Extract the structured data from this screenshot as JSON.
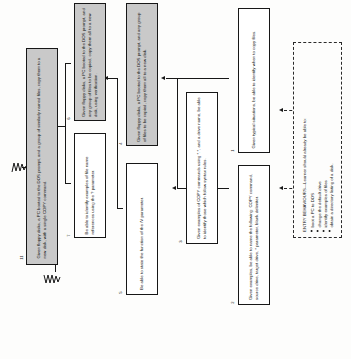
{
  "diagram": {
    "type": "instructional-goal-hierarchy",
    "title_visible": false,
    "colors": {
      "shaded_fill": "#c9c9c9",
      "line": "#171717",
      "paper": "#fdfdfc"
    },
    "orientation": "rotated-90-ccw"
  },
  "nodes": [
    {
      "id": "11",
      "tag": "11",
      "shaded": true,
      "text": "Given floppy disks, a PC booted to the DOS prompt, and a group of similarly named files, copy them to a new disk, with a single COPY command."
    },
    {
      "id": "6",
      "tag": "6",
      "shaded": true,
      "text": "Given floppy disks, a PC booted to the DOS prompt, and any group of files to be copied, copy them all to a new disk, using verification."
    },
    {
      "id": "7",
      "tag": "7",
      "shaded": false,
      "text": "Be able to identify examples of file name references using the ? parameter."
    },
    {
      "id": "4",
      "tag": "4",
      "shaded": true,
      "text": "Given floppy disks, a PC booted to the DOS prompt, and any group of files to be copied, copy them all to a new disk."
    },
    {
      "id": "5",
      "tag": "5",
      "shaded": false,
      "text": "Be able to state the function of the /V parameter."
    },
    {
      "id": "3",
      "tag": "3",
      "shaded": false,
      "text": "Given examples of COPY commands using *.*, and a drive name, be able to identify those which follow syntax rules."
    },
    {
      "id": "1",
      "tag": "1",
      "shaded": false,
      "text": "Given typical situations, be able to identify when to copy files."
    },
    {
      "id": "2",
      "tag": "2",
      "shaded": false,
      "text": "Given examples, be able to name the following: COPY command, source drive, target drive, * parameter, blank delimiter."
    }
  ],
  "entry_behaviours": {
    "title": "ENTRY BEHAVIOURS—Learner should already be able to:",
    "items": [
      "boot a PC to DOS",
      "change the default drive",
      "identify examples of files",
      "obtain a directory listing of a disk."
    ]
  }
}
